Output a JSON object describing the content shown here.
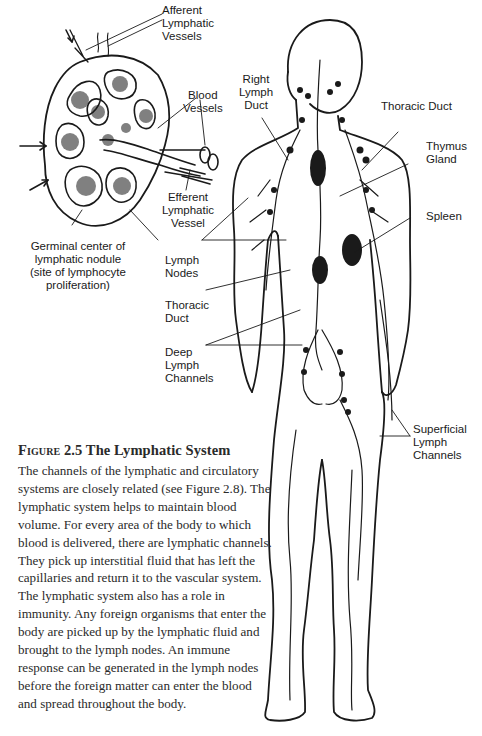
{
  "figure": {
    "number_label": "Figure 2.5",
    "title": "The Lymphatic System",
    "body": "The channels of the lymphatic and circulatory systems are closely related (see Figure 2.8). The lymphatic system helps to maintain blood volume. For every area of the body to which blood is delivered, there are lymphatic channels. They pick up interstitial fluid that has left the capillaries and return it to the vascular system. The lymphatic system also has a role in immunity. Any foreign organisms that enter the body are picked up by the lymphatic fluid and brought to the lymph nodes. An immune response can be generated in the lymph nodes before the foreign matter can enter the blood and spread throughout the body."
  },
  "node_inset": {
    "labels": {
      "afferent": "Afferent\nLymphatic\nVessels",
      "blood_vessels": "Blood\nVessels",
      "efferent": "Efferent\nLymphatic\nVessel",
      "germinal": "Germinal center of\nlymphatic nodule\n(site of lymphocyte\nproliferation)"
    }
  },
  "body_labels": {
    "right_lymph_duct": "Right\nLymph\nDuct",
    "thoracic_duct_top": "Thoracic Duct",
    "thymus": "Thymus\nGland",
    "spleen": "Spleen",
    "lymph_nodes": "Lymph\nNodes",
    "thoracic_duct_mid": "Thoracic\nDuct",
    "deep_channels": "Deep\nLymph\nChannels",
    "superficial_channels": "Superficial\nLymph\nChannels"
  },
  "colors": {
    "ink": "#1a1a1a",
    "paper": "#ffffff"
  }
}
